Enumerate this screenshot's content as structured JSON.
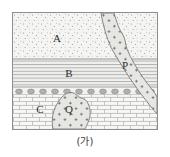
{
  "figure": {
    "caption": "(가)",
    "frame_color": "#8d8d8d",
    "background_color": "#ffffff"
  },
  "diagram": {
    "type": "geologic-cross-section",
    "labels": {
      "layer_a": "A",
      "layer_b": "B",
      "layer_c": "C",
      "dike_p": "P",
      "pluton_q": "Q"
    },
    "units": [
      {
        "id": "A",
        "label": "A",
        "pattern": "stipple-dots",
        "description": "uppermost sandstone layer with dotted stipple texture",
        "fill": "#f4f4f2",
        "dot_color": "#7c7c7c",
        "top": 0,
        "bottom": 46,
        "label_x": 44,
        "label_y": 28
      },
      {
        "id": "B",
        "label": "B",
        "pattern": "horizontal-lines",
        "description": "middle shale layer drawn with horizontal ruled lines",
        "fill": "#efefef",
        "line_color": "#9a9a9a",
        "top": 46,
        "bottom": 74,
        "label_x": 56,
        "label_y": 63
      },
      {
        "id": "pebble-band",
        "label": "",
        "pattern": "pebble-circles",
        "description": "thin conglomerate band of gray pebbles marking an unconformity",
        "fill": "#f2f2f0",
        "circle_color": "#a0a0a0",
        "top": 74,
        "bottom": 82,
        "pebble_count": 12
      },
      {
        "id": "C",
        "label": "C",
        "pattern": "brick",
        "description": "lowermost limestone layer drawn with brick pattern",
        "fill": "#f6f6f4",
        "line_color": "#a8a8a8",
        "top": 82,
        "bottom": 116,
        "label_x": 27,
        "label_y": 99
      }
    ],
    "intrusions": [
      {
        "id": "P",
        "label": "P",
        "kind": "dike",
        "description": "diagonal igneous dike cutting from top edge down to lower right, filled with cross marks",
        "fill": "#e2e2de",
        "outline": "#7b7b7b",
        "cross_color": "#6a6a6a",
        "label_x": 112,
        "label_y": 55
      },
      {
        "id": "Q",
        "label": "Q",
        "kind": "pluton",
        "description": "rounded granite plug intruding the lower limestone layer, filled with cross marks",
        "fill": "#e4e4e0",
        "outline": "#7b7b7b",
        "cross_color": "#6a6a6a",
        "label_x": 55,
        "label_y": 99
      }
    ]
  }
}
